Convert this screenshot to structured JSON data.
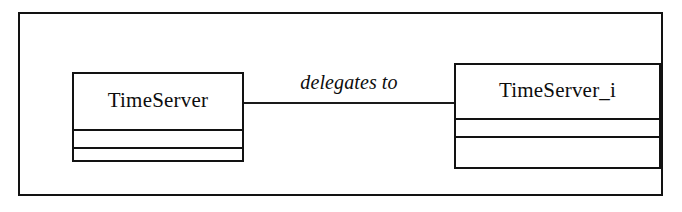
{
  "diagram": {
    "kind": "uml-class-diagram",
    "frame": {
      "label": ""
    },
    "classes": [
      {
        "id": "timeserver",
        "name": "TimeServer",
        "attributes_compartment": "",
        "operations_compartment": ""
      },
      {
        "id": "timeserver_i",
        "name": "TimeServer_i",
        "attributes_compartment": "",
        "operations_compartment": ""
      }
    ],
    "associations": [
      {
        "id": "delegation",
        "label": "delegates to",
        "from": "TimeServer",
        "to": "TimeServer_i"
      }
    ],
    "colors": {
      "stroke": "#121212",
      "background": "#ffffff",
      "text": "#0d0d0d"
    }
  }
}
